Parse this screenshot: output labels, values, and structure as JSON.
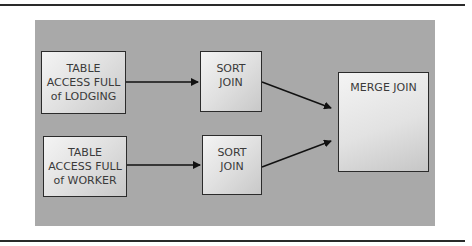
{
  "diagram": {
    "nodes": [
      {
        "id": "table_access_lodging",
        "lines": [
          "TABLE",
          "ACCESS FULL",
          "of LODGING"
        ]
      },
      {
        "id": "table_access_worker",
        "lines": [
          "TABLE",
          "ACCESS FULL",
          "of WORKER"
        ]
      },
      {
        "id": "sort_join_1",
        "lines": [
          "SORT",
          "JOIN"
        ]
      },
      {
        "id": "sort_join_2",
        "lines": [
          "SORT",
          "JOIN"
        ]
      },
      {
        "id": "merge_join",
        "lines": [
          "MERGE JOIN"
        ]
      }
    ],
    "edges": [
      {
        "from": "table_access_lodging",
        "to": "sort_join_1"
      },
      {
        "from": "table_access_worker",
        "to": "sort_join_2"
      },
      {
        "from": "sort_join_1",
        "to": "merge_join"
      },
      {
        "from": "sort_join_2",
        "to": "merge_join"
      }
    ],
    "colors": {
      "panel": "#a9a9a9",
      "box_border": "#2b2b2b",
      "text": "#3a3a3a",
      "rule": "#2a2a2a"
    }
  }
}
